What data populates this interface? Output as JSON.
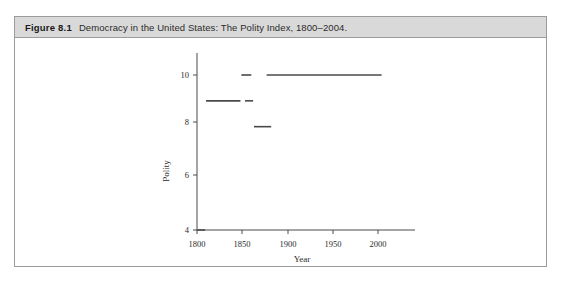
{
  "figure": {
    "label": "Figure 8.1",
    "caption": "Democracy in the United States: The Polity Index, 1800–2004."
  },
  "chart_data": {
    "type": "line",
    "title": "Democracy in the United States: The Polity Index, 1800–2004.",
    "xlabel": "Year",
    "ylabel": "Polity",
    "xlim": [
      1795,
      2012
    ],
    "ylim": [
      3.6,
      10.4
    ],
    "xticks": [
      1800,
      1850,
      1900,
      1950,
      2000
    ],
    "xtick_labels": [
      "1800",
      "1850",
      "1900",
      "1950",
      "2000"
    ],
    "yticks": [
      4,
      6,
      8,
      10
    ],
    "ytick_labels": [
      "4",
      "6",
      "8",
      "10"
    ],
    "grid": false,
    "legend": null,
    "line_color": "#4a4a4a",
    "series": [
      {
        "name": "Polity Index",
        "style": "step-segments",
        "segments": [
          {
            "x_start": 1800,
            "x_end": 1809,
            "y": 4
          },
          {
            "x_start": 1810,
            "x_end": 1848,
            "y": 9
          },
          {
            "x_start": 1849,
            "x_end": 1860,
            "y": 10
          },
          {
            "x_start": 1853,
            "x_end": 1862,
            "y": 9
          },
          {
            "x_start": 1863,
            "x_end": 1882,
            "y": 8
          },
          {
            "x_start": 1877,
            "x_end": 2004,
            "y": 10
          }
        ]
      }
    ]
  },
  "axes": {
    "x_axis_name": "year-axis",
    "y_axis_name": "polity-axis"
  }
}
